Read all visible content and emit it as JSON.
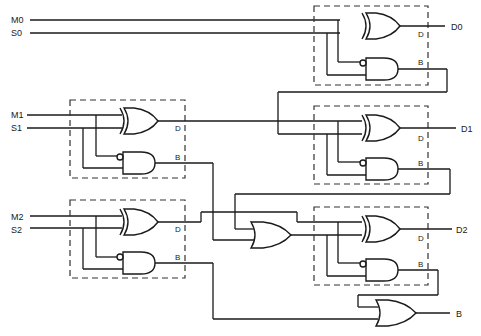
{
  "diagram": {
    "type": "logic-circuit",
    "colors": {
      "wire": "#1a1a1a",
      "box": "#333333",
      "background": "#ffffff"
    },
    "inputs": [
      {
        "id": "M0",
        "label": "M0"
      },
      {
        "id": "S0",
        "label": "S0"
      },
      {
        "id": "M1",
        "label": "M1"
      },
      {
        "id": "S1",
        "label": "S1"
      },
      {
        "id": "M2",
        "label": "M2"
      },
      {
        "id": "S2",
        "label": "S2"
      }
    ],
    "outputs": [
      {
        "id": "D0",
        "label": "D0"
      },
      {
        "id": "D1",
        "label": "D1"
      },
      {
        "id": "D2",
        "label": "D2"
      },
      {
        "id": "B",
        "label": "B"
      }
    ],
    "half_subtractor_port_labels": {
      "difference": "D",
      "borrow": "B"
    },
    "blocks": [
      {
        "id": "hs-1",
        "inputs": [
          "M1",
          "S1"
        ]
      },
      {
        "id": "hs-2",
        "inputs": [
          "M2",
          "S2"
        ]
      },
      {
        "id": "hs-3",
        "inputs": [
          "M0",
          "S0"
        ],
        "outputs": [
          "D0"
        ]
      },
      {
        "id": "hs-4",
        "inputs": [
          "hs-1.D",
          "hs-3.B"
        ],
        "outputs": [
          "D1"
        ]
      },
      {
        "id": "hs-5",
        "inputs": [
          "hs-2.D",
          "or-1"
        ],
        "outputs": [
          "D2"
        ]
      }
    ],
    "or_gates": [
      {
        "id": "or-1",
        "inputs": [
          "hs-4.B",
          "hs-1.B"
        ]
      },
      {
        "id": "or-2",
        "inputs": [
          "hs-5.B",
          "hs-2.B"
        ],
        "output": "B"
      }
    ]
  }
}
